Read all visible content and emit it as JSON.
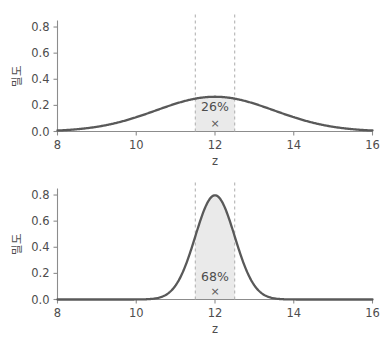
{
  "figure": {
    "background_color": "#ffffff",
    "curve_color": "#595959",
    "shade_color": "#e8e8e8",
    "dash_color": "#b3b3b3",
    "axis_color": "#8c8c8c",
    "text_color": "#4d4d4d"
  },
  "chart_data": [
    {
      "type": "line",
      "title": "",
      "xlabel": "z",
      "ylabel": "밀도",
      "xlim": [
        8,
        16
      ],
      "ylim": [
        0.0,
        0.85
      ],
      "grid": false,
      "legend": "none",
      "xticks": [
        8,
        10,
        12,
        14,
        16
      ],
      "xtick_labels": [
        "8",
        "10",
        "12",
        "14",
        "16"
      ],
      "yticks": [
        0.0,
        0.2,
        0.4,
        0.6,
        0.8
      ],
      "ytick_labels": [
        "0.0",
        "0.2",
        "0.4",
        "0.6",
        "0.8"
      ],
      "distribution": {
        "name": "normal",
        "mean": 12,
        "sd": 1.5,
        "peak_density": 0.266
      },
      "shaded_interval": {
        "lower": 11.5,
        "upper": 12.5,
        "label": "26%",
        "area": 0.26
      },
      "marker": {
        "symbol": "×",
        "x": 12,
        "y": 0.0
      },
      "x": [
        8.0,
        8.4,
        8.8,
        9.2,
        9.6,
        10.0,
        10.4,
        10.8,
        11.2,
        11.6,
        12.0,
        12.4,
        12.8,
        13.2,
        13.6,
        14.0,
        14.4,
        14.8,
        15.2,
        15.6,
        16.0
      ],
      "y": [
        0.0076,
        0.0129,
        0.0208,
        0.0321,
        0.0473,
        0.0666,
        0.0895,
        0.1146,
        0.1402,
        0.1637,
        0.1825,
        0.1941,
        0.1971,
        0.1911,
        0.1772,
        0.1573,
        0.1336,
        0.1083,
        0.0838,
        0.062,
        0.0438
      ]
    },
    {
      "type": "line",
      "title": "",
      "xlabel": "z",
      "ylabel": "밀도",
      "xlim": [
        8,
        16
      ],
      "ylim": [
        0.0,
        0.85
      ],
      "grid": false,
      "legend": "none",
      "xticks": [
        8,
        10,
        12,
        14,
        16
      ],
      "xtick_labels": [
        "8",
        "10",
        "12",
        "14",
        "16"
      ],
      "yticks": [
        0.0,
        0.2,
        0.4,
        0.6,
        0.8
      ],
      "ytick_labels": [
        "0.0",
        "0.2",
        "0.4",
        "0.6",
        "0.8"
      ],
      "distribution": {
        "name": "normal",
        "mean": 12,
        "sd": 0.5,
        "peak_density": 0.798
      },
      "shaded_interval": {
        "lower": 11.5,
        "upper": 12.5,
        "label": "68%",
        "area": 0.68
      },
      "marker": {
        "symbol": "×",
        "x": 12,
        "y": 0.0
      },
      "x": [
        8.0,
        8.4,
        8.8,
        9.2,
        9.6,
        10.0,
        10.4,
        10.8,
        11.2,
        11.6,
        12.0,
        12.4,
        12.8,
        13.2,
        13.6,
        14.0,
        14.4,
        14.8,
        15.2,
        15.6,
        16.0
      ],
      "y": [
        0.0,
        0.0,
        0.0,
        0.0,
        0.0002,
        0.0027,
        0.0238,
        0.1295,
        0.435,
        0.7365,
        0.7979,
        0.7365,
        0.435,
        0.1295,
        0.0238,
        0.0027,
        0.0002,
        0.0,
        0.0,
        0.0,
        0.0
      ]
    }
  ]
}
